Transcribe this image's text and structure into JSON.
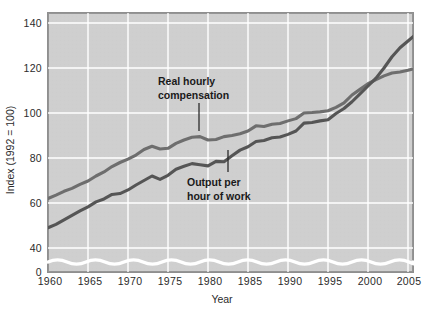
{
  "chart_data": {
    "type": "line",
    "title": "",
    "xlabel": "Year",
    "ylabel": "Index (1992 = 100)",
    "xlim": [
      1960,
      2007
    ],
    "ylim": [
      0,
      140
    ],
    "y_axis_break": true,
    "y_break_note": "wavy break between 0 and ~30",
    "grid": true,
    "legend_position": "inline-annotations",
    "xticks": [
      "1960",
      "1965",
      "1970",
      "1975",
      "1980",
      "1985",
      "1990",
      "1995",
      "2000",
      "2005"
    ],
    "xtick_values": [
      1960,
      1965,
      1970,
      1975,
      1980,
      1985,
      1990,
      1995,
      2000,
      2005
    ],
    "yticks": [
      "0",
      "40",
      "60",
      "80",
      "100",
      "120",
      "140"
    ],
    "ytick_values": [
      0,
      40,
      60,
      80,
      100,
      120,
      140
    ],
    "x": [
      1960,
      1961,
      1962,
      1963,
      1964,
      1965,
      1966,
      1967,
      1968,
      1969,
      1970,
      1971,
      1972,
      1973,
      1974,
      1975,
      1976,
      1977,
      1978,
      1979,
      1980,
      1981,
      1982,
      1983,
      1984,
      1985,
      1986,
      1987,
      1988,
      1989,
      1990,
      1991,
      1992,
      1993,
      1994,
      1995,
      1996,
      1997,
      1998,
      1999,
      2000,
      2001,
      2002,
      2003,
      2004,
      2005,
      2006,
      2007
    ],
    "series": [
      {
        "name": "Real hourly compensation",
        "color": "#6e6e6e",
        "label_lines": [
          "Real hourly",
          "compensation"
        ],
        "values": [
          62.0,
          63.5,
          65.2,
          66.5,
          68.3,
          69.8,
          72.0,
          73.8,
          76.2,
          78.0,
          79.5,
          81.3,
          83.8,
          85.2,
          84.0,
          84.3,
          86.5,
          88.0,
          89.2,
          89.5,
          88.0,
          88.2,
          89.5,
          90.0,
          90.8,
          92.0,
          94.3,
          94.0,
          95.0,
          95.3,
          96.5,
          97.5,
          100.0,
          100.2,
          100.5,
          101.0,
          102.5,
          104.5,
          108.0,
          110.5,
          113.0,
          114.8,
          116.5,
          117.8,
          118.2,
          119.0,
          120.0,
          121.0
        ]
      },
      {
        "name": "Output per hour of work",
        "color": "#555555",
        "label_lines": [
          "Output per",
          "hour of work"
        ],
        "values": [
          49.0,
          50.5,
          52.5,
          54.5,
          56.5,
          58.3,
          60.5,
          61.8,
          63.8,
          64.2,
          65.8,
          68.0,
          70.0,
          72.0,
          70.5,
          72.3,
          75.0,
          76.3,
          77.5,
          77.0,
          76.5,
          78.5,
          78.3,
          81.0,
          83.5,
          85.0,
          87.3,
          87.8,
          89.0,
          89.3,
          90.5,
          92.0,
          95.5,
          95.8,
          96.5,
          97.0,
          99.8,
          102.0,
          105.0,
          108.5,
          112.0,
          115.5,
          120.0,
          125.0,
          129.0,
          132.0,
          135.0,
          137.5
        ]
      }
    ]
  },
  "axis": {
    "y_label": "Index (1992 = 100)",
    "x_label": "Year"
  },
  "annotations": {
    "compensation": {
      "line1": "Real hourly",
      "line2": "compensation"
    },
    "output": {
      "line1": "Output per",
      "line2": "hour of work"
    }
  },
  "colors": {
    "plot_background": "#cfcfcf",
    "gridline": "#ffffff",
    "frame": "#8c8c8c",
    "compensation_line": "#6e6e6e",
    "output_line": "#4f4f4f",
    "text": "#2b2b2b"
  }
}
